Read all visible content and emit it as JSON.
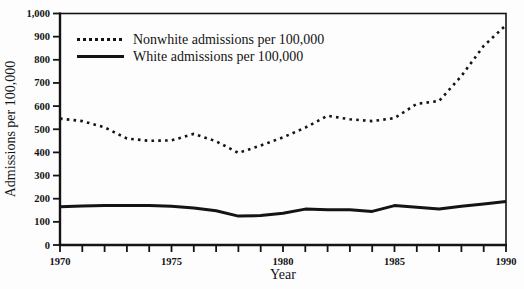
{
  "chart_data": {
    "type": "line",
    "title": "",
    "xlabel": "Year",
    "ylabel": "Admissions per 100,000",
    "x": [
      1970,
      1971,
      1972,
      1973,
      1974,
      1975,
      1976,
      1977,
      1978,
      1979,
      1980,
      1981,
      1982,
      1983,
      1984,
      1985,
      1986,
      1987,
      1988,
      1989,
      1990
    ],
    "xlim": [
      1970,
      1990
    ],
    "ylim": [
      0,
      1000
    ],
    "ytick_values": [
      0,
      100,
      200,
      300,
      400,
      500,
      600,
      700,
      800,
      900,
      1000
    ],
    "ytick_labels": [
      "0",
      "100",
      "200",
      "300",
      "400",
      "500",
      "600",
      "700",
      "800",
      "900",
      "1,000"
    ],
    "xtick_label_values": [
      1970,
      1975,
      1980,
      1985,
      1990
    ],
    "xtick_minor_step": 1,
    "grid": false,
    "frame": "box",
    "ink_color": "#141414",
    "background_color": "#fdfdfd",
    "legend": {
      "position": "top-left-inside",
      "items": [
        {
          "label": "Nonwhite admissions per 100,000",
          "line_style": "dotted"
        },
        {
          "label": "White admissions per 100,000",
          "line_style": "solid"
        }
      ]
    },
    "series": [
      {
        "name": "Nonwhite admissions per 100,000",
        "line_style": "dotted",
        "values": [
          546,
          535,
          508,
          460,
          450,
          452,
          480,
          448,
          398,
          430,
          465,
          507,
          558,
          543,
          535,
          548,
          610,
          622,
          730,
          860,
          950
        ]
      },
      {
        "name": "White admissions per 100,000",
        "line_style": "solid",
        "values": [
          165,
          168,
          170,
          170,
          170,
          167,
          160,
          148,
          125,
          127,
          137,
          155,
          152,
          152,
          145,
          170,
          163,
          155,
          167,
          177,
          188
        ]
      }
    ]
  }
}
